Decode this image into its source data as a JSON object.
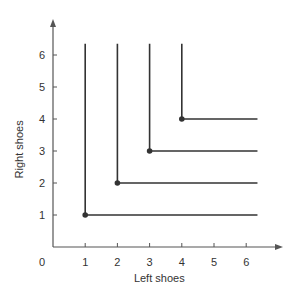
{
  "chart_data": {
    "type": "line",
    "title": "",
    "xlabel": "Left shoes",
    "ylabel": "Right shoes",
    "origin_label": "0",
    "xlim": [
      0,
      6.8
    ],
    "ylim": [
      0,
      6.8
    ],
    "x_ticks": [
      1,
      2,
      3,
      4,
      5,
      6
    ],
    "y_ticks": [
      1,
      2,
      3,
      4,
      5,
      6
    ],
    "grid": false,
    "legend": null,
    "series": [
      {
        "name": "Indifference curve 1",
        "corner": [
          1,
          1
        ],
        "points": [
          [
            1,
            6.35
          ],
          [
            1,
            1
          ],
          [
            6.35,
            1
          ]
        ]
      },
      {
        "name": "Indifference curve 2",
        "corner": [
          2,
          2
        ],
        "points": [
          [
            2,
            6.35
          ],
          [
            2,
            2
          ],
          [
            6.35,
            2
          ]
        ]
      },
      {
        "name": "Indifference curve 3",
        "corner": [
          3,
          3
        ],
        "points": [
          [
            3,
            6.35
          ],
          [
            3,
            3
          ],
          [
            6.35,
            3
          ]
        ]
      },
      {
        "name": "Indifference curve 4",
        "corner": [
          4,
          4
        ],
        "points": [
          [
            4,
            6.35
          ],
          [
            4,
            4
          ],
          [
            6.35,
            4
          ]
        ]
      }
    ]
  },
  "colors": {
    "axis": "#555555",
    "curve": "#333333",
    "text": "#333333"
  }
}
